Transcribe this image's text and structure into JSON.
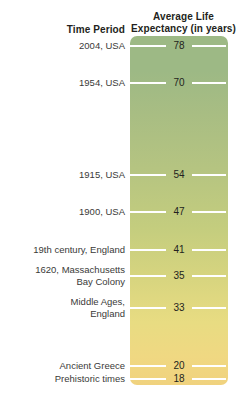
{
  "headers": {
    "time_period": "Time Period",
    "life_expectancy_line1": "Average Life",
    "life_expectancy_line2": "Expectancy (in years)"
  },
  "colors": {
    "gradient_top": "#9db985",
    "gradient_middle": "#c4cd7e",
    "gradient_bottom": "#f0d882",
    "tick_line": "#ffffff",
    "header_text": "#231f20",
    "label_text": "#3a3a38",
    "background": "#ffffff"
  },
  "chart_data": {
    "type": "bar",
    "title": "Average Life Expectancy (in years)",
    "xlabel": "Time Period",
    "ylabel": "Average Life Expectancy (in years)",
    "orientation": "vertical-scale",
    "grid": false,
    "legend": "none",
    "ylim": [
      0,
      80
    ],
    "categories": [
      "2004, USA",
      "1954, USA",
      "1915, USA",
      "1900, USA",
      "19th century, England",
      "1620,  Massachusetts\nBay Colony",
      "Middle Ages,\nEngland",
      "Ancient Greece",
      "Prehistoric times"
    ],
    "values": [
      78,
      70,
      54,
      47,
      41,
      35,
      33,
      20,
      18
    ],
    "rows": [
      {
        "label": "2004, USA",
        "value": "78",
        "lines": 1,
        "y": 46
      },
      {
        "label": "1954, USA",
        "value": "70",
        "lines": 1,
        "y": 83
      },
      {
        "label": "1915, USA",
        "value": "54",
        "lines": 1,
        "y": 175
      },
      {
        "label": "1900, USA",
        "value": "47",
        "lines": 1,
        "y": 212
      },
      {
        "label": "19th century, England",
        "value": "41",
        "lines": 1,
        "y": 250
      },
      {
        "label": "1620,  Massachusetts\nBay Colony",
        "value": "35",
        "lines": 2,
        "y": 276
      },
      {
        "label": "Middle Ages,\nEngland",
        "value": "33",
        "lines": 2,
        "y": 308
      },
      {
        "label": "Ancient Greece",
        "value": "20",
        "lines": 1,
        "y": 366
      },
      {
        "label": "Prehistoric times",
        "value": "18",
        "lines": 1,
        "y": 379
      }
    ]
  }
}
